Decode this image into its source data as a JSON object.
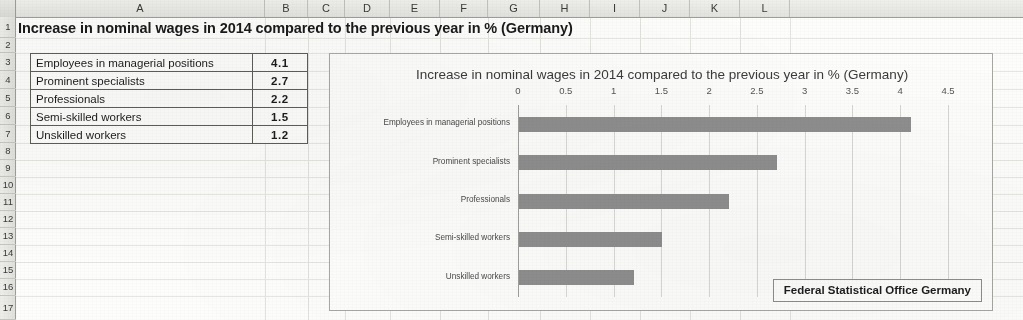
{
  "app": {
    "type": "spreadsheet",
    "column_headers": [
      "A",
      "B",
      "C",
      "D",
      "E",
      "F",
      "G",
      "H",
      "I",
      "J",
      "K",
      "L"
    ],
    "row_headers": [
      "1",
      "2",
      "3",
      "4",
      "5",
      "6",
      "7",
      "8",
      "9",
      "10",
      "11",
      "12",
      "13",
      "14",
      "15",
      "16",
      "17"
    ]
  },
  "title_cell": {
    "ref": "A1",
    "text": "Increase in nominal wages in 2014 compared to the previous year in % (Germany)"
  },
  "table": {
    "rows": [
      {
        "row": "3",
        "label": "Employees in managerial positions",
        "value": "4.1"
      },
      {
        "row": "4",
        "label": "Prominent specialists",
        "value": "2.7"
      },
      {
        "row": "5",
        "label": "Professionals",
        "value": "2.2"
      },
      {
        "row": "6",
        "label": "Semi-skilled workers",
        "value": "1.5"
      },
      {
        "row": "7",
        "label": "Unskilled workers",
        "value": "1.2"
      }
    ]
  },
  "chart": {
    "title": "Increase in nominal wages in 2014 compared to the previous year in % (Germany)",
    "annotation": "Federal Statistical Office Germany",
    "bar_color": "#8e8e8e",
    "gridline_color": "#d8d8d4",
    "axis_color": "#9e9e9a"
  },
  "chart_data": {
    "type": "bar",
    "orientation": "horizontal",
    "title": "Increase in nominal wages in 2014 compared to the previous year in % (Germany)",
    "xlabel": "",
    "ylabel": "",
    "categories": [
      "Employees in managerial positions",
      "Prominent specialists",
      "Professionals",
      "Semi-skilled workers",
      "Unskilled workers"
    ],
    "values": [
      4.1,
      2.7,
      2.2,
      1.5,
      1.2
    ],
    "xlim": [
      0,
      4.5
    ],
    "xticks": [
      0,
      0.5,
      1,
      1.5,
      2,
      2.5,
      3,
      3.5,
      4,
      4.5
    ],
    "xticklabels": [
      "0",
      "0.5",
      "1",
      "1.5",
      "2",
      "2.5",
      "3",
      "3.5",
      "4",
      "4.5"
    ],
    "grid": "vertical",
    "legend": "none",
    "annotations": [
      "Federal Statistical Office Germany"
    ],
    "units": "%"
  }
}
